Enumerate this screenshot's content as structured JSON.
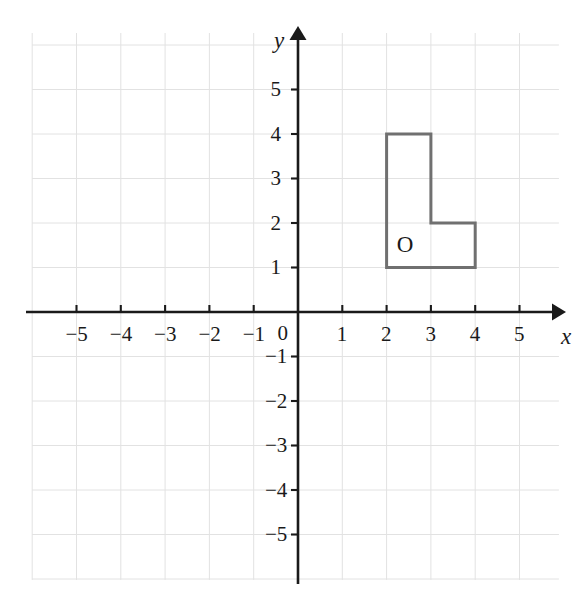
{
  "figure": {
    "title": "",
    "background_color": "#ffffff",
    "grid_color": "#e2e2e2",
    "axis_color": "#1a1a1a",
    "shape_stroke_color": "#707070",
    "label_color": "#1a1a1a"
  },
  "chart_data": {
    "type": "scatter",
    "title": "",
    "xlabel": "x",
    "ylabel": "y",
    "xlim": [
      -6,
      6.5
    ],
    "ylim": [
      -6.3,
      6.3
    ],
    "grid": true,
    "grid_spacing": 1,
    "legend": "none",
    "x_tick_labels": [
      "−5",
      "−4",
      "−3",
      "−2",
      "−1",
      "0",
      "1",
      "2",
      "3",
      "4",
      "5"
    ],
    "x_tick_values": [
      -5,
      -4,
      -3,
      -2,
      -1,
      0,
      1,
      2,
      3,
      4,
      5
    ],
    "y_tick_labels": [
      "5",
      "4",
      "3",
      "2",
      "1",
      "−1",
      "−2",
      "−3",
      "−4",
      "−5"
    ],
    "y_tick_values": [
      5,
      4,
      3,
      2,
      1,
      -1,
      -2,
      -3,
      -4,
      -5
    ],
    "origin_label": "0",
    "shapes": [
      {
        "name": "L-shape",
        "label": "O",
        "label_position": [
          2.42,
          1.52
        ],
        "closed": true,
        "fill": "none",
        "stroke": "#707070",
        "vertices": [
          [
            2,
            4
          ],
          [
            3,
            4
          ],
          [
            3,
            2
          ],
          [
            4,
            2
          ],
          [
            4,
            1
          ],
          [
            2,
            1
          ]
        ]
      }
    ]
  },
  "axes": {
    "x_axis_name": "x",
    "y_axis_name": "y",
    "x_arrow": "right-arrow",
    "y_arrow": "up-arrow"
  }
}
